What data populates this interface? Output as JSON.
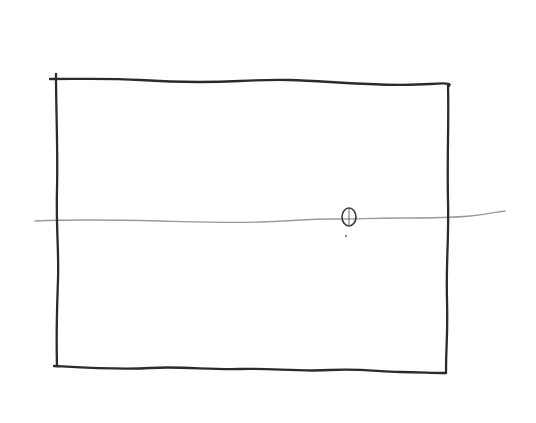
{
  "sketch": {
    "type": "hand-drawn pencil sketch",
    "colors": {
      "background": "#ffffff",
      "frame_stroke": "#2b2b2b",
      "horizon_stroke": "#9a9a9a",
      "marker_stroke": "#3a3a3a"
    },
    "elements": {
      "frame": {
        "shape": "rectangle",
        "corners": {
          "top_left": [
            55,
            79
          ],
          "top_right": [
            448,
            86
          ],
          "bottom_right": [
            444,
            373
          ],
          "bottom_left": [
            55,
            366
          ]
        }
      },
      "horizon_line": {
        "shape": "line",
        "from": [
          35,
          221
        ],
        "to": [
          505,
          211
        ]
      },
      "marker": {
        "shape": "oval",
        "center": [
          349,
          217
        ],
        "size": [
          14,
          18
        ],
        "dot": [
          346,
          236
        ]
      }
    }
  }
}
